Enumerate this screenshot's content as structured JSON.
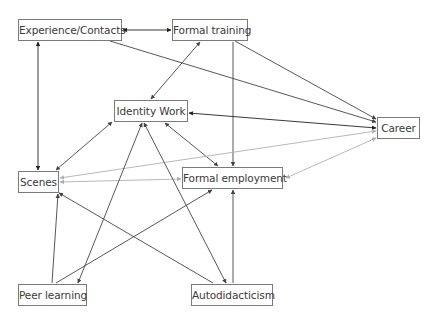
{
  "diagram": {
    "type": "directed-graph",
    "nodes": [
      {
        "id": "exp",
        "label": "Experience/Contacts",
        "x": 18,
        "y": 19,
        "w": 104,
        "h": 22
      },
      {
        "id": "ftr",
        "label": "Formal training",
        "x": 172,
        "y": 19,
        "w": 76,
        "h": 22
      },
      {
        "id": "idw",
        "label": "Identity Work",
        "x": 114,
        "y": 100,
        "w": 74,
        "h": 22
      },
      {
        "id": "car",
        "label": "Career",
        "x": 377,
        "y": 117,
        "w": 43,
        "h": 22
      },
      {
        "id": "sce",
        "label": "Scenes",
        "x": 18,
        "y": 171,
        "w": 41,
        "h": 22
      },
      {
        "id": "femp",
        "label": "Formal employment",
        "x": 182,
        "y": 167,
        "w": 101,
        "h": 22
      },
      {
        "id": "peer",
        "label": "Peer learning",
        "x": 18,
        "y": 284,
        "w": 69,
        "h": 22
      },
      {
        "id": "auto",
        "label": "Autodidacticism",
        "x": 191,
        "y": 284,
        "w": 82,
        "h": 22
      }
    ],
    "edges": [
      {
        "from": "exp",
        "to": "ftr",
        "x1": 123,
        "y1": 30,
        "x2": 171,
        "y2": 30,
        "start_arrow": true,
        "end_arrow": true,
        "color": "#222222"
      },
      {
        "from": "exp",
        "to": "sce",
        "x1": 38,
        "y1": 42,
        "x2": 38,
        "y2": 170,
        "start_arrow": true,
        "end_arrow": true,
        "color": "#222222"
      },
      {
        "from": "exp",
        "to": "car",
        "x1": 110,
        "y1": 41,
        "x2": 376,
        "y2": 122,
        "start_arrow": false,
        "end_arrow": true,
        "color": "#444444"
      },
      {
        "from": "ftr",
        "to": "idw",
        "x1": 200,
        "y1": 42,
        "x2": 151,
        "y2": 99,
        "start_arrow": true,
        "end_arrow": true,
        "color": "#444444"
      },
      {
        "from": "ftr",
        "to": "femp",
        "x1": 233,
        "y1": 42,
        "x2": 233,
        "y2": 166,
        "start_arrow": false,
        "end_arrow": true,
        "color": "#444444"
      },
      {
        "from": "ftr",
        "to": "car",
        "x1": 235,
        "y1": 41,
        "x2": 376,
        "y2": 119,
        "start_arrow": false,
        "end_arrow": true,
        "color": "#444444"
      },
      {
        "from": "idw",
        "to": "car",
        "x1": 189,
        "y1": 113,
        "x2": 376,
        "y2": 128,
        "start_arrow": true,
        "end_arrow": true,
        "color": "#222222"
      },
      {
        "from": "idw",
        "to": "sce",
        "x1": 112,
        "y1": 122,
        "x2": 56,
        "y2": 170,
        "start_arrow": true,
        "end_arrow": true,
        "color": "#444444"
      },
      {
        "from": "idw",
        "to": "femp",
        "x1": 165,
        "y1": 123,
        "x2": 218,
        "y2": 166,
        "start_arrow": true,
        "end_arrow": true,
        "color": "#444444"
      },
      {
        "from": "car",
        "to": "sce",
        "x1": 376,
        "y1": 131,
        "x2": 60,
        "y2": 178,
        "start_arrow": true,
        "end_arrow": true,
        "color": "#b0b0b0"
      },
      {
        "from": "car",
        "to": "femp",
        "x1": 376,
        "y1": 138,
        "x2": 286,
        "y2": 178,
        "start_arrow": true,
        "end_arrow": true,
        "color": "#b0b0b0"
      },
      {
        "from": "sce",
        "to": "femp",
        "x1": 60,
        "y1": 182,
        "x2": 181,
        "y2": 179,
        "start_arrow": true,
        "end_arrow": true,
        "color": "#b0b0b0"
      },
      {
        "from": "peer",
        "to": "sce",
        "x1": 52,
        "y1": 283,
        "x2": 58,
        "y2": 194,
        "start_arrow": false,
        "end_arrow": true,
        "color": "#444444"
      },
      {
        "from": "peer",
        "to": "idw",
        "x1": 78,
        "y1": 283,
        "x2": 142,
        "y2": 123,
        "start_arrow": true,
        "end_arrow": true,
        "color": "#444444"
      },
      {
        "from": "peer",
        "to": "femp",
        "x1": 56,
        "y1": 283,
        "x2": 212,
        "y2": 190,
        "start_arrow": false,
        "end_arrow": true,
        "color": "#444444"
      },
      {
        "from": "auto",
        "to": "sce",
        "x1": 213,
        "y1": 283,
        "x2": 59,
        "y2": 193,
        "start_arrow": false,
        "end_arrow": true,
        "color": "#444444"
      },
      {
        "from": "auto",
        "to": "idw",
        "x1": 226,
        "y1": 283,
        "x2": 144,
        "y2": 123,
        "start_arrow": true,
        "end_arrow": true,
        "color": "#444444"
      },
      {
        "from": "auto",
        "to": "femp",
        "x1": 233,
        "y1": 283,
        "x2": 233,
        "y2": 190,
        "start_arrow": false,
        "end_arrow": true,
        "color": "#444444"
      }
    ]
  }
}
